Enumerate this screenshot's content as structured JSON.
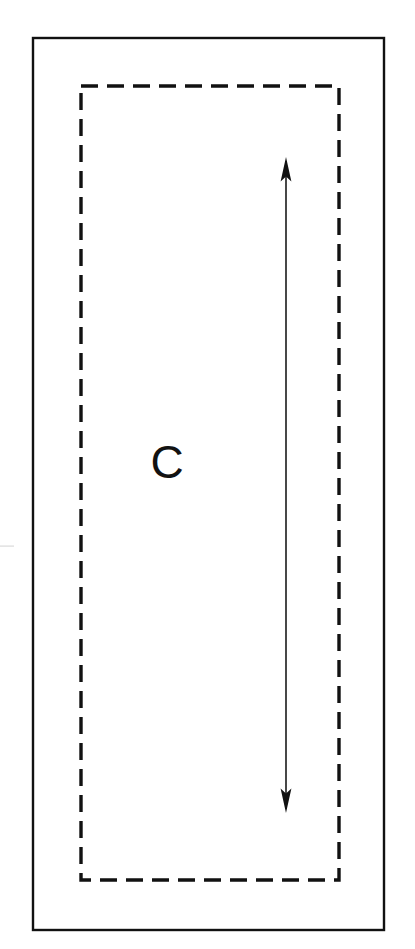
{
  "figure": {
    "canvas": {
      "width": 415,
      "height": 949,
      "background_color": "#ffffff"
    },
    "outer_frame": {
      "name": "outer-solid-rectangle",
      "x": 33,
      "y": 38,
      "width": 351,
      "height": 892,
      "stroke_color": "#111111",
      "stroke_width": 2.4,
      "style": "solid",
      "fill": "none"
    },
    "inner_region": {
      "name": "inner-dashed-rectangle",
      "x": 81,
      "y": 86,
      "width": 258,
      "height": 794,
      "stroke_color": "#111111",
      "stroke_width": 3.4,
      "style": "dashed",
      "dash_length": 17,
      "dash_gap": 9,
      "fill": "none"
    },
    "region_label": {
      "name": "region-label-c",
      "text": "C",
      "x": 167,
      "y": 461,
      "font_size": 46,
      "color": "#121212"
    },
    "dimension_arrow": {
      "name": "vertical-double-arrow",
      "x": 286,
      "y_top": 157,
      "y_bottom": 813,
      "length": 656,
      "shaft_width": 1.6,
      "head_width": 11,
      "head_length": 21,
      "heads": "both",
      "color": "#1a1a1a",
      "orientation": "vertical"
    },
    "scan_artifact": {
      "name": "scan-line-artifact",
      "x": 0,
      "y": 546,
      "width": 14,
      "height": 1,
      "color": "#d8d8d8"
    }
  }
}
